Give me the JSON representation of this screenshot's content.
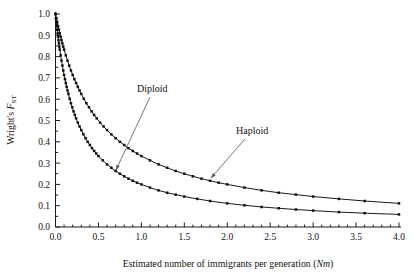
{
  "figure": {
    "name": "fst-vs-nm-plot",
    "background": "#ffffff",
    "ink_color": "#111111",
    "leader_color": "#555555"
  },
  "axes": {
    "x": {
      "label_main": "Estimated number of immigrants per generation (",
      "label_var": "Nm",
      "label_close": ")",
      "min": 0.0,
      "max": 4.0,
      "major_step": 0.5,
      "minor_step": 0.1,
      "tick_labels": [
        "0.0",
        "0.5",
        "1.0",
        "1.5",
        "2.0",
        "2.5",
        "3.0",
        "3.5",
        "4.0"
      ],
      "tick_values": [
        0.0,
        0.5,
        1.0,
        1.5,
        2.0,
        2.5,
        3.0,
        3.5,
        4.0
      ]
    },
    "y": {
      "label_main": "Wright's ",
      "label_var": "F",
      "label_sub": "ST",
      "min": 0.0,
      "max": 1.0,
      "major_step": 0.1,
      "minor_step": 0.05,
      "tick_labels": [
        "0.0",
        "0.1",
        "0.2",
        "0.3",
        "0.4",
        "0.5",
        "0.6",
        "0.7",
        "0.8",
        "0.9",
        "1.0"
      ],
      "tick_values": [
        0.0,
        0.1,
        0.2,
        0.3,
        0.4,
        0.5,
        0.6,
        0.7,
        0.8,
        0.9,
        1.0
      ]
    }
  },
  "annotations": [
    {
      "name": "diploid-label",
      "text": "Diploid",
      "text_x": 137,
      "text_y": 92,
      "leader_from_x": 150,
      "leader_from_y": 97,
      "leader_to_x": 116,
      "leader_to_y": 170,
      "arrow_angle_deg": 245
    },
    {
      "name": "haploid-label",
      "text": "Haploid",
      "text_x": 236,
      "text_y": 134,
      "leader_from_x": 245,
      "leader_from_y": 139,
      "leader_to_x": 211,
      "leader_to_y": 178,
      "arrow_angle_deg": 229
    }
  ],
  "chart_data": {
    "type": "line",
    "title": "",
    "xlabel": "Estimated number of immigrants per generation (Nm)",
    "ylabel": "Wright's FST",
    "xlim": [
      0.0,
      4.0
    ],
    "ylim": [
      0.0,
      1.0
    ],
    "grid": false,
    "legend": "inline-annotations",
    "markers": "filled-square",
    "series": [
      {
        "name": "Haploid",
        "formula": "Fst = 1 / (1 + 2*Nm)",
        "x": [
          0.0,
          0.01,
          0.02,
          0.03,
          0.04,
          0.05,
          0.06,
          0.07,
          0.08,
          0.09,
          0.1,
          0.12,
          0.14,
          0.16,
          0.18,
          0.2,
          0.22,
          0.24,
          0.26,
          0.28,
          0.3,
          0.33,
          0.36,
          0.39,
          0.42,
          0.45,
          0.48,
          0.52,
          0.56,
          0.6,
          0.65,
          0.7,
          0.75,
          0.8,
          0.85,
          0.9,
          0.95,
          1.0,
          1.1,
          1.2,
          1.3,
          1.4,
          1.5,
          1.6,
          1.7,
          1.8,
          1.9,
          2.0,
          2.2,
          2.4,
          2.6,
          2.8,
          3.0,
          3.3,
          3.6,
          4.0
        ],
        "y": [
          1.0,
          0.98,
          0.962,
          0.943,
          0.926,
          0.909,
          0.893,
          0.877,
          0.862,
          0.847,
          0.833,
          0.806,
          0.781,
          0.758,
          0.735,
          0.714,
          0.694,
          0.676,
          0.658,
          0.641,
          0.625,
          0.602,
          0.581,
          0.562,
          0.543,
          0.526,
          0.51,
          0.49,
          0.472,
          0.455,
          0.435,
          0.417,
          0.4,
          0.385,
          0.37,
          0.357,
          0.345,
          0.333,
          0.313,
          0.294,
          0.278,
          0.263,
          0.25,
          0.238,
          0.227,
          0.217,
          0.208,
          0.2,
          0.185,
          0.172,
          0.161,
          0.152,
          0.143,
          0.132,
          0.122,
          0.111
        ]
      },
      {
        "name": "Diploid",
        "formula": "Fst = 1 / (1 + 4*Nm)",
        "x": [
          0.0,
          0.005,
          0.01,
          0.015,
          0.02,
          0.025,
          0.03,
          0.035,
          0.04,
          0.045,
          0.05,
          0.06,
          0.07,
          0.08,
          0.09,
          0.1,
          0.11,
          0.12,
          0.13,
          0.14,
          0.15,
          0.165,
          0.18,
          0.195,
          0.21,
          0.225,
          0.24,
          0.26,
          0.28,
          0.3,
          0.325,
          0.35,
          0.375,
          0.4,
          0.425,
          0.45,
          0.475,
          0.5,
          0.55,
          0.6,
          0.65,
          0.7,
          0.75,
          0.8,
          0.85,
          0.9,
          0.95,
          1.0,
          1.1,
          1.2,
          1.3,
          1.4,
          1.5,
          1.65,
          1.8,
          2.0,
          2.2,
          2.4,
          2.6,
          2.8,
          3.0,
          3.3,
          3.6,
          4.0
        ],
        "y": [
          1.0,
          0.98,
          0.962,
          0.943,
          0.926,
          0.909,
          0.893,
          0.877,
          0.862,
          0.847,
          0.833,
          0.806,
          0.781,
          0.758,
          0.735,
          0.714,
          0.694,
          0.676,
          0.658,
          0.641,
          0.625,
          0.602,
          0.581,
          0.562,
          0.543,
          0.526,
          0.51,
          0.49,
          0.472,
          0.455,
          0.435,
          0.417,
          0.4,
          0.385,
          0.37,
          0.357,
          0.345,
          0.333,
          0.313,
          0.294,
          0.278,
          0.263,
          0.25,
          0.238,
          0.227,
          0.217,
          0.208,
          0.2,
          0.185,
          0.172,
          0.161,
          0.152,
          0.143,
          0.132,
          0.122,
          0.111,
          0.102,
          0.094,
          0.088,
          0.082,
          0.077,
          0.07,
          0.065,
          0.059
        ]
      }
    ]
  }
}
